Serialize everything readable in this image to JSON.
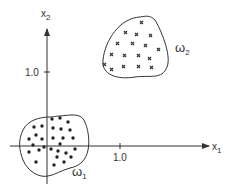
{
  "diagram": {
    "type": "scatter-clusters",
    "colors": {
      "ink": "#333333",
      "background": "#ffffff"
    },
    "axes": {
      "x": {
        "label": "x",
        "subscript": "1",
        "tick_label": "1.0"
      },
      "y": {
        "label": "x",
        "subscript": "2",
        "tick_label": "1.0"
      }
    },
    "classes": [
      {
        "name": "ω",
        "subscript": "1",
        "marker": "dot",
        "count": 28
      },
      {
        "name": "ω",
        "subscript": "2",
        "marker": "cross",
        "count": 17
      }
    ]
  }
}
